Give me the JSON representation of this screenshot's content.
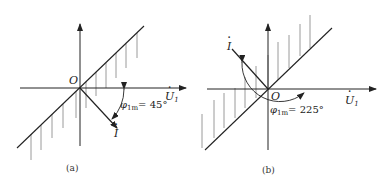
{
  "figure": {
    "panels": [
      {
        "id": "a",
        "caption": "(a)",
        "origin_label": "O",
        "voltage_label": "U",
        "voltage_subscript": "1",
        "current_label": "I",
        "angle_symbol": "φ",
        "angle_subscript": "1m",
        "angle_value": "= 45°"
      },
      {
        "id": "b",
        "caption": "(b)",
        "origin_label": "O",
        "voltage_label": "U",
        "voltage_subscript": "1",
        "current_label": "I",
        "angle_symbol": "φ",
        "angle_subscript": "1m",
        "angle_value": "= 225°"
      }
    ]
  },
  "colors": {
    "line": "#222222",
    "hatch": "#9a9a9a",
    "background": "#ffffff"
  }
}
